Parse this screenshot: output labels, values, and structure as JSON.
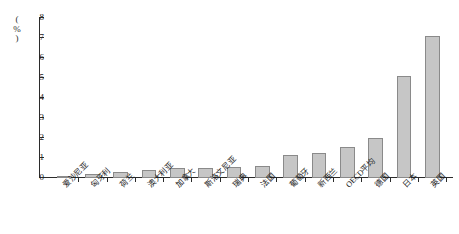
{
  "chart_data": {
    "type": "bar",
    "title": "",
    "subtitle": "",
    "xlabel": "",
    "ylabel": "(%)",
    "ylim": [
      0,
      8
    ],
    "ytick_labels": [
      "0",
      "1",
      "2",
      "3",
      "4",
      "5",
      "6",
      "7",
      "8"
    ],
    "ytick_values": [
      0,
      1,
      2,
      3,
      4,
      5,
      6,
      7,
      8
    ],
    "grid": false,
    "legend": false,
    "bar_color": "#c6c6c6",
    "bar_border_color": "#8a8a8a",
    "axis_color": "#2b2b2b",
    "categories": [
      "爱沙尼亚",
      "匈牙利",
      "荷兰",
      "澳大利亚",
      "加拿大",
      "斯洛文尼亚",
      "瑞典",
      "法国",
      "葡萄牙",
      "新西兰",
      "OECD平均",
      "德国",
      "日本",
      "英国"
    ],
    "values": [
      0.08,
      0.18,
      0.3,
      0.42,
      0.48,
      0.48,
      0.55,
      0.6,
      1.15,
      1.27,
      1.53,
      1.98,
      5.1,
      7.1
    ]
  }
}
